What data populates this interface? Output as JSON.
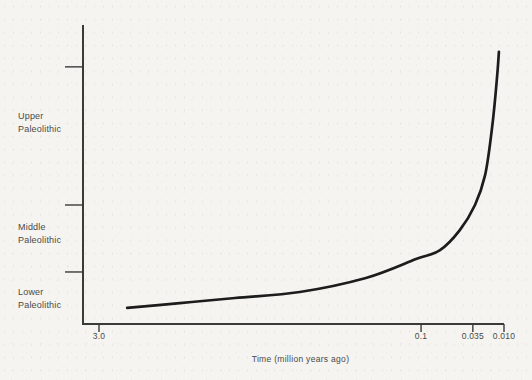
{
  "chart_data": {
    "type": "line",
    "title": "",
    "xlabel": "Time (million years ago)",
    "ylabel": "",
    "x_axis": {
      "tick_labels": [
        "3.0",
        "0.1",
        "0.035",
        "0.010"
      ],
      "ticks": [
        {
          "label": "3.0",
          "frac": 0.038
        },
        {
          "label": "0.1",
          "frac": 0.803
        },
        {
          "label": "0.035",
          "frac": 0.926
        },
        {
          "label": "0.010",
          "frac": 1.0
        }
      ]
    },
    "y_axis": {
      "bands": [
        {
          "label": "Lower Paleolithic",
          "center_frac": 0.082
        },
        {
          "label": "Middle Paleolithic",
          "center_frac": 0.301
        },
        {
          "label": "Upper Paleolithic",
          "center_frac": 0.671
        }
      ],
      "boundary_tick_fracs": [
        0.174,
        0.398,
        0.86
      ]
    },
    "series": [
      {
        "name": "growth-curve",
        "points_frac": [
          [
            0.105,
            0.054
          ],
          [
            0.23,
            0.07
          ],
          [
            0.361,
            0.087
          ],
          [
            0.515,
            0.107
          ],
          [
            0.672,
            0.154
          ],
          [
            0.791,
            0.217
          ],
          [
            0.848,
            0.247
          ],
          [
            0.895,
            0.314
          ],
          [
            0.931,
            0.398
          ],
          [
            0.955,
            0.498
          ],
          [
            0.971,
            0.649
          ],
          [
            0.983,
            0.816
          ],
          [
            0.988,
            0.91
          ]
        ]
      }
    ],
    "legend": "none",
    "grid": "off"
  },
  "colors": {
    "paper": "#f5f4f1",
    "axis": "#3a3a38",
    "curve": "#1c1c1c",
    "text": "#4a4a47"
  }
}
